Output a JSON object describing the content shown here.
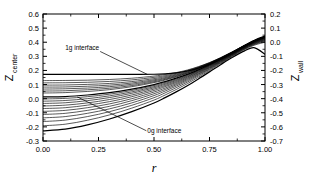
{
  "figure": {
    "background": "#ffffff",
    "line_color": "#000000",
    "frame": {
      "left": 43,
      "right": 265,
      "top": 14,
      "bottom": 141
    }
  },
  "chart_data": {
    "type": "line",
    "title": "",
    "xlabel": "r",
    "ylabel": "Z_center",
    "ylabel2": "Z_wall",
    "xlim": [
      0.0,
      1.0
    ],
    "ylim": [
      -0.3,
      0.6
    ],
    "ylim2": [
      -0.7,
      0.2
    ],
    "grid": false,
    "legend": "none",
    "xticks": [
      "0.00",
      "0.25",
      "0.50",
      "0.75",
      "1.00"
    ],
    "xtick_values": [
      0.0,
      0.25,
      0.5,
      0.75,
      1.0
    ],
    "yticks_left": [
      "0.6",
      "0.5",
      "0.4",
      "0.3",
      "0.2",
      "0.1",
      "0.0",
      "-0.1",
      "-0.2",
      "-0.3"
    ],
    "ytick_values_left": [
      0.6,
      0.5,
      0.4,
      0.3,
      0.2,
      0.1,
      0.0,
      -0.1,
      -0.2,
      -0.3
    ],
    "yticks_right": [
      "0.2",
      "0.1",
      "0.0",
      "-0.1",
      "-0.2",
      "-0.3",
      "-0.4",
      "-0.5",
      "-0.6",
      "-0.7"
    ],
    "ytick_values_right": [
      0.2,
      0.1,
      0.0,
      -0.1,
      -0.2,
      -0.3,
      -0.4,
      -0.5,
      -0.6,
      -0.7
    ],
    "annotations": [
      {
        "text": "1g interface",
        "x": 0.1,
        "y": 0.345,
        "leader_to_x": 0.47,
        "leader_to_y": 0.172
      },
      {
        "text": "0g interface",
        "x": 0.47,
        "y": -0.245,
        "leader_to_x": 0.155,
        "leader_to_y": 0.012
      }
    ],
    "series": [
      {
        "name": "curve-01-1g-interface",
        "emphasis": "heavy",
        "x": [
          0.0,
          0.1,
          0.2,
          0.3,
          0.4,
          0.5,
          0.55,
          0.6,
          0.65,
          0.7,
          0.75,
          0.8,
          0.85,
          0.9,
          0.95,
          1.0
        ],
        "y": [
          0.172,
          0.172,
          0.172,
          0.172,
          0.172,
          0.173,
          0.176,
          0.183,
          0.196,
          0.216,
          0.245,
          0.282,
          0.324,
          0.37,
          0.412,
          0.443
        ]
      },
      {
        "name": "curve-02",
        "emphasis": "normal",
        "x": [
          0.0,
          0.1,
          0.2,
          0.3,
          0.4,
          0.5,
          0.55,
          0.6,
          0.65,
          0.7,
          0.75,
          0.8,
          0.85,
          0.9,
          0.95,
          1.0
        ],
        "y": [
          0.128,
          0.129,
          0.131,
          0.136,
          0.145,
          0.16,
          0.171,
          0.185,
          0.203,
          0.227,
          0.256,
          0.291,
          0.33,
          0.372,
          0.411,
          0.44
        ]
      },
      {
        "name": "curve-03",
        "emphasis": "normal",
        "x": [
          0.0,
          0.1,
          0.2,
          0.3,
          0.4,
          0.5,
          0.55,
          0.6,
          0.65,
          0.7,
          0.75,
          0.8,
          0.85,
          0.9,
          0.95,
          1.0
        ],
        "y": [
          0.112,
          0.113,
          0.116,
          0.122,
          0.133,
          0.151,
          0.163,
          0.179,
          0.199,
          0.224,
          0.254,
          0.289,
          0.329,
          0.371,
          0.41,
          0.44
        ]
      },
      {
        "name": "curve-04",
        "emphasis": "normal",
        "x": [
          0.0,
          0.1,
          0.2,
          0.3,
          0.4,
          0.5,
          0.55,
          0.6,
          0.65,
          0.7,
          0.75,
          0.8,
          0.85,
          0.9,
          0.95,
          1.0
        ],
        "y": [
          0.096,
          0.097,
          0.101,
          0.108,
          0.121,
          0.142,
          0.156,
          0.173,
          0.194,
          0.221,
          0.252,
          0.288,
          0.328,
          0.37,
          0.409,
          0.439
        ]
      },
      {
        "name": "curve-05",
        "emphasis": "normal",
        "x": [
          0.0,
          0.1,
          0.2,
          0.3,
          0.4,
          0.5,
          0.55,
          0.6,
          0.65,
          0.7,
          0.75,
          0.8,
          0.85,
          0.9,
          0.95,
          1.0
        ],
        "y": [
          0.082,
          0.083,
          0.088,
          0.096,
          0.111,
          0.134,
          0.149,
          0.168,
          0.19,
          0.218,
          0.25,
          0.287,
          0.327,
          0.369,
          0.408,
          0.438
        ]
      },
      {
        "name": "curve-06",
        "emphasis": "normal",
        "x": [
          0.0,
          0.1,
          0.2,
          0.3,
          0.4,
          0.5,
          0.55,
          0.6,
          0.65,
          0.7,
          0.75,
          0.8,
          0.85,
          0.9,
          0.95,
          1.0
        ],
        "y": [
          0.068,
          0.07,
          0.075,
          0.085,
          0.102,
          0.127,
          0.143,
          0.163,
          0.186,
          0.215,
          0.248,
          0.285,
          0.326,
          0.368,
          0.407,
          0.437
        ]
      },
      {
        "name": "curve-07",
        "emphasis": "normal",
        "x": [
          0.0,
          0.1,
          0.2,
          0.3,
          0.4,
          0.5,
          0.55,
          0.6,
          0.65,
          0.7,
          0.75,
          0.8,
          0.85,
          0.9,
          0.95,
          1.0
        ],
        "y": [
          0.054,
          0.056,
          0.063,
          0.074,
          0.093,
          0.12,
          0.137,
          0.158,
          0.182,
          0.212,
          0.246,
          0.283,
          0.324,
          0.367,
          0.406,
          0.436
        ]
      },
      {
        "name": "curve-08",
        "emphasis": "normal",
        "x": [
          0.0,
          0.1,
          0.2,
          0.3,
          0.4,
          0.5,
          0.55,
          0.6,
          0.65,
          0.7,
          0.75,
          0.8,
          0.85,
          0.9,
          0.95,
          1.0
        ],
        "y": [
          0.04,
          0.043,
          0.051,
          0.064,
          0.085,
          0.114,
          0.132,
          0.154,
          0.179,
          0.209,
          0.244,
          0.282,
          0.323,
          0.366,
          0.405,
          0.435
        ]
      },
      {
        "name": "curve-09-0g-interface",
        "emphasis": "heavy",
        "x": [
          0.0,
          0.1,
          0.2,
          0.3,
          0.4,
          0.5,
          0.55,
          0.6,
          0.65,
          0.7,
          0.75,
          0.8,
          0.85,
          0.9,
          0.95,
          1.0
        ],
        "y": [
          0.012,
          0.015,
          0.026,
          0.042,
          0.067,
          0.1,
          0.121,
          0.145,
          0.172,
          0.204,
          0.24,
          0.279,
          0.321,
          0.364,
          0.404,
          0.434
        ]
      },
      {
        "name": "curve-10",
        "emphasis": "normal",
        "x": [
          0.0,
          0.1,
          0.2,
          0.3,
          0.4,
          0.5,
          0.55,
          0.6,
          0.65,
          0.7,
          0.75,
          0.8,
          0.85,
          0.9,
          0.95,
          1.0
        ],
        "y": [
          -0.002,
          0.002,
          0.014,
          0.032,
          0.058,
          0.093,
          0.115,
          0.14,
          0.168,
          0.201,
          0.238,
          0.277,
          0.32,
          0.363,
          0.403,
          0.433
        ]
      },
      {
        "name": "curve-11",
        "emphasis": "normal",
        "x": [
          0.0,
          0.1,
          0.2,
          0.3,
          0.4,
          0.5,
          0.55,
          0.6,
          0.65,
          0.7,
          0.75,
          0.8,
          0.85,
          0.9,
          0.95,
          1.0
        ],
        "y": [
          -0.018,
          -0.013,
          0.0,
          0.02,
          0.048,
          0.085,
          0.108,
          0.134,
          0.163,
          0.197,
          0.235,
          0.275,
          0.318,
          0.361,
          0.401,
          0.431
        ]
      },
      {
        "name": "curve-12",
        "emphasis": "normal",
        "x": [
          0.0,
          0.1,
          0.2,
          0.3,
          0.4,
          0.5,
          0.55,
          0.6,
          0.65,
          0.7,
          0.75,
          0.8,
          0.85,
          0.9,
          0.95,
          1.0
        ],
        "y": [
          -0.034,
          -0.029,
          -0.014,
          0.008,
          0.038,
          0.077,
          0.101,
          0.128,
          0.158,
          0.193,
          0.232,
          0.273,
          0.316,
          0.36,
          0.399,
          0.428
        ]
      },
      {
        "name": "curve-13",
        "emphasis": "normal",
        "x": [
          0.0,
          0.1,
          0.2,
          0.3,
          0.4,
          0.5,
          0.55,
          0.6,
          0.65,
          0.7,
          0.75,
          0.8,
          0.85,
          0.9,
          0.95,
          1.0
        ],
        "y": [
          -0.052,
          -0.046,
          -0.03,
          -0.006,
          0.026,
          0.068,
          0.093,
          0.121,
          0.153,
          0.189,
          0.229,
          0.27,
          0.314,
          0.358,
          0.397,
          0.425
        ]
      },
      {
        "name": "curve-14",
        "emphasis": "normal",
        "x": [
          0.0,
          0.1,
          0.2,
          0.3,
          0.4,
          0.5,
          0.55,
          0.6,
          0.65,
          0.7,
          0.75,
          0.8,
          0.85,
          0.9,
          0.95,
          1.0
        ],
        "y": [
          -0.07,
          -0.064,
          -0.046,
          -0.021,
          0.014,
          0.058,
          0.085,
          0.114,
          0.147,
          0.184,
          0.225,
          0.268,
          0.312,
          0.356,
          0.395,
          0.422
        ]
      },
      {
        "name": "curve-15",
        "emphasis": "normal",
        "x": [
          0.0,
          0.1,
          0.2,
          0.3,
          0.4,
          0.5,
          0.55,
          0.6,
          0.65,
          0.7,
          0.75,
          0.8,
          0.85,
          0.9,
          0.95,
          1.0
        ],
        "y": [
          -0.09,
          -0.083,
          -0.064,
          -0.037,
          0.0,
          0.047,
          0.075,
          0.106,
          0.141,
          0.179,
          0.221,
          0.265,
          0.31,
          0.354,
          0.392,
          0.419
        ]
      },
      {
        "name": "curve-16",
        "emphasis": "normal",
        "x": [
          0.0,
          0.1,
          0.2,
          0.3,
          0.4,
          0.5,
          0.55,
          0.6,
          0.65,
          0.7,
          0.75,
          0.8,
          0.85,
          0.9,
          0.95,
          1.0
        ],
        "y": [
          -0.112,
          -0.104,
          -0.083,
          -0.054,
          -0.014,
          0.035,
          0.065,
          0.098,
          0.134,
          0.174,
          0.217,
          0.262,
          0.307,
          0.352,
          0.39,
          0.416
        ]
      },
      {
        "name": "curve-17",
        "emphasis": "normal",
        "x": [
          0.0,
          0.1,
          0.2,
          0.3,
          0.4,
          0.5,
          0.55,
          0.6,
          0.65,
          0.7,
          0.75,
          0.8,
          0.85,
          0.9,
          0.95,
          1.0
        ],
        "y": [
          -0.136,
          -0.127,
          -0.104,
          -0.072,
          -0.03,
          0.022,
          0.054,
          0.089,
          0.126,
          0.168,
          0.212,
          0.258,
          0.304,
          0.349,
          0.386,
          0.412
        ]
      },
      {
        "name": "curve-18",
        "emphasis": "normal",
        "x": [
          0.0,
          0.1,
          0.2,
          0.3,
          0.4,
          0.5,
          0.55,
          0.6,
          0.65,
          0.7,
          0.75,
          0.8,
          0.85,
          0.9,
          0.95,
          1.0
        ],
        "y": [
          -0.162,
          -0.152,
          -0.127,
          -0.092,
          -0.047,
          0.007,
          0.041,
          0.078,
          0.117,
          0.161,
          0.207,
          0.254,
          0.301,
          0.346,
          0.383,
          0.407
        ]
      },
      {
        "name": "curve-19",
        "emphasis": "normal",
        "x": [
          0.0,
          0.1,
          0.2,
          0.3,
          0.4,
          0.5,
          0.55,
          0.6,
          0.65,
          0.7,
          0.75,
          0.8,
          0.85,
          0.9,
          0.95,
          1.0
        ],
        "y": [
          -0.192,
          -0.181,
          -0.153,
          -0.115,
          -0.067,
          -0.01,
          0.026,
          0.065,
          0.106,
          0.152,
          0.2,
          0.249,
          0.297,
          0.342,
          0.378,
          0.4
        ]
      },
      {
        "name": "curve-20-outer",
        "emphasis": "heavy",
        "x": [
          0.0,
          0.1,
          0.2,
          0.3,
          0.4,
          0.5,
          0.55,
          0.6,
          0.65,
          0.7,
          0.75,
          0.8,
          0.85,
          0.9,
          0.95,
          1.0
        ],
        "y": [
          -0.228,
          -0.216,
          -0.186,
          -0.144,
          -0.092,
          -0.031,
          0.007,
          0.048,
          0.092,
          0.14,
          0.19,
          0.241,
          0.29,
          0.333,
          0.362,
          0.315
        ]
      }
    ]
  }
}
